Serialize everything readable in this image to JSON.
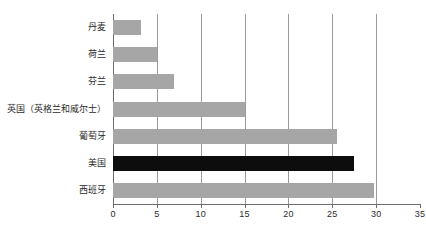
{
  "chart_data": {
    "type": "bar",
    "orientation": "horizontal",
    "title": "",
    "subtitle": "",
    "xlabel": "",
    "ylabel": "",
    "xlim": [
      0,
      35
    ],
    "ylim": null,
    "grid": true,
    "legend": null,
    "xticks": [
      "0",
      "5",
      "10",
      "15",
      "20",
      "25",
      "30",
      "35"
    ],
    "xtick_values": [
      0,
      5,
      10,
      15,
      20,
      25,
      30,
      35
    ],
    "categories": [
      "丹麦",
      "荷兰",
      "芬兰",
      "英国（英格兰和威尔士）",
      "葡萄牙",
      "美国",
      "西班牙"
    ],
    "values": [
      3.2,
      5,
      7,
      15,
      25.5,
      27.5,
      29.8
    ],
    "bar_colors": [
      "#a6a6a6",
      "#a6a6a6",
      "#a6a6a6",
      "#a6a6a6",
      "#a6a6a6",
      "#0d0d0d",
      "#a6a6a6"
    ],
    "highlighted_category": "美国",
    "bars": [
      {
        "label": "丹麦",
        "value": 3.2,
        "color": "#a6a6a6"
      },
      {
        "label": "荷兰",
        "value": 5,
        "color": "#a6a6a6"
      },
      {
        "label": "芬兰",
        "value": 7,
        "color": "#a6a6a6"
      },
      {
        "label": "英国（英格兰和威尔士）",
        "value": 15,
        "color": "#a6a6a6"
      },
      {
        "label": "葡萄牙",
        "value": 25.5,
        "color": "#a6a6a6"
      },
      {
        "label": "美国",
        "value": 27.5,
        "color": "#0d0d0d"
      },
      {
        "label": "西班牙",
        "value": 29.8,
        "color": "#a6a6a6"
      }
    ]
  },
  "colors": {
    "bar_default": "#a6a6a6",
    "bar_highlight": "#0d0d0d",
    "gridline": "#9a9a9a",
    "axis": "#6d6d6d",
    "text": "#2b2b2b",
    "background": "#ffffff"
  }
}
